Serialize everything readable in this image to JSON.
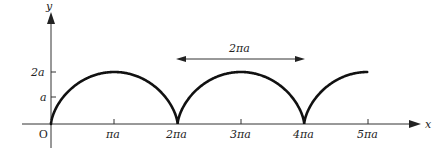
{
  "diagram": {
    "type": "cycloid",
    "axes": {
      "x_label": "x",
      "y_label": "y",
      "origin_label": "O"
    },
    "x_ticks": [
      {
        "label": "πa",
        "value": 1
      },
      {
        "label": "2πa",
        "value": 2
      },
      {
        "label": "3πa",
        "value": 3
      },
      {
        "label": "4πa",
        "value": 4
      },
      {
        "label": "5πa",
        "value": 5
      }
    ],
    "y_ticks": [
      {
        "label": "a",
        "value": 1
      },
      {
        "label": "2a",
        "value": 2
      }
    ],
    "period_annotation": {
      "label": "2πa",
      "from": "2πa",
      "to": "4πa"
    },
    "curve": {
      "description": "Cycloid arches with cusps at 0, 2πa, 4πa; max height 2a; drawn up to 5πa",
      "color": "#111111"
    }
  }
}
